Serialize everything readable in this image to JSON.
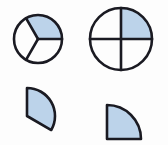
{
  "figure": {
    "width": 168,
    "height": 145,
    "background_color": "#fdfdfd",
    "stroke_color": "#1a1a22",
    "shaded_fill_color": "#bcd3ea",
    "unshaded_fill_color": "#fdfdfd",
    "shapes": [
      {
        "id": "circle-thirds",
        "name": "circle-divided-in-thirds",
        "kind": "circle",
        "parts_total": 3,
        "parts_shaded": 1,
        "fraction_label": "1/3",
        "center_x": 38,
        "center_y": 39,
        "radius": 24,
        "stroke_width": 2.6,
        "divider_angles_deg": [
          0,
          120,
          240
        ],
        "shaded_sector": {
          "start_deg": 0,
          "end_deg": 120
        }
      },
      {
        "id": "circle-quarters",
        "name": "circle-divided-in-quarters",
        "kind": "circle",
        "parts_total": 4,
        "parts_shaded": 1,
        "fraction_label": "1/4",
        "center_x": 121,
        "center_y": 39,
        "radius": 31,
        "stroke_width": 2.6,
        "divider_angles_deg": [
          0,
          90,
          180,
          270
        ],
        "shaded_sector": {
          "start_deg": 0,
          "end_deg": 90
        }
      },
      {
        "id": "sector-third",
        "name": "detached-third-sector",
        "kind": "sector",
        "parts_total": 3,
        "parts_shaded": 1,
        "fraction_label": "1/3",
        "apex_x": 27,
        "apex_y": 116,
        "radius": 28,
        "sweep_deg": 120,
        "start_deg": -60,
        "stroke_width": 2.6
      },
      {
        "id": "sector-quarter",
        "name": "detached-quarter-sector",
        "kind": "sector",
        "parts_total": 4,
        "parts_shaded": 1,
        "fraction_label": "1/4",
        "apex_x": 107,
        "apex_y": 139,
        "radius": 34,
        "sweep_deg": 90,
        "start_deg": 0,
        "stroke_width": 2.6
      }
    ]
  }
}
